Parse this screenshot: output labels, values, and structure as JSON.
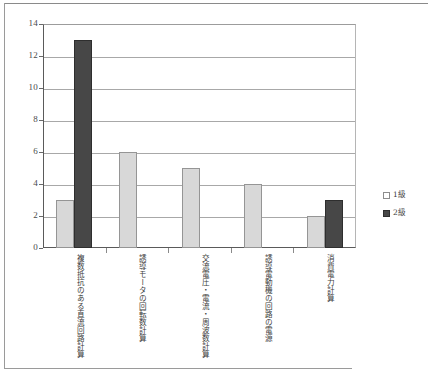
{
  "chart_data": {
    "type": "bar",
    "title": "",
    "xlabel": "",
    "ylabel": "",
    "ylim": [
      0,
      14
    ],
    "yticks": [
      0,
      2,
      4,
      6,
      8,
      10,
      12,
      14
    ],
    "grid": true,
    "legend_position": "right",
    "categories": [
      "複数抵抗のある直流回路計算",
      "誘導モータの回転数計算",
      "交流電圧・電流・周波数計算",
      "誘導電動機の回路の電源",
      "消費電力計算"
    ],
    "series": [
      {
        "name": "1級",
        "color": "#d8d8d8",
        "values": [
          3,
          6,
          5,
          4,
          2
        ]
      },
      {
        "name": "2級",
        "color": "#474747",
        "values": [
          13,
          0,
          0,
          0,
          3
        ]
      }
    ]
  },
  "axis": {
    "y_tick_labels": [
      "0",
      "2",
      "4",
      "6",
      "8",
      "10",
      "12",
      "14"
    ]
  },
  "legend": {
    "items": [
      {
        "label": "1級",
        "swatch": "series-1-swatch"
      },
      {
        "label": "2級",
        "swatch": "series-2-swatch"
      }
    ]
  },
  "colors": {
    "series_1": "#d8d8d8",
    "series_2": "#474747",
    "gridline": "#a8a8a8",
    "axis": "#5a5a5a"
  }
}
